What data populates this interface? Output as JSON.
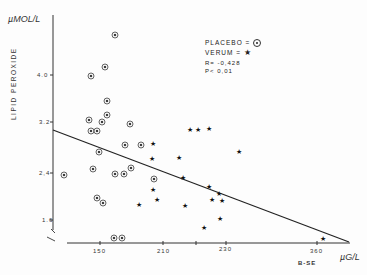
{
  "chart_data": {
    "type": "scatter",
    "title": "",
    "xlabel": "B-SE",
    "x_unit": "µG/L",
    "ylabel": "LIPID PEROXIDE",
    "y_unit": "µMOL/L",
    "x_ticks": [
      "150",
      "210",
      "230",
      "360"
    ],
    "y_ticks": [
      "4.0",
      "3.2",
      "2.4",
      "1.6"
    ],
    "ylim": [
      1.3,
      5.2
    ],
    "grid": false,
    "legend_position": "upper right",
    "annotations": [
      "R = -0.428",
      "P < 0.01"
    ],
    "series": [
      {
        "name": "PLACEBO",
        "marker": "circled-dot",
        "points": [
          [
            160,
            5.0
          ],
          [
            152,
            4.0
          ],
          [
            150,
            3.2
          ],
          [
            153,
            3.1
          ],
          [
            148,
            3.1
          ],
          [
            155,
            3.1
          ],
          [
            153,
            3.4
          ],
          [
            160,
            3.5
          ],
          [
            165,
            2.9
          ],
          [
            170,
            2.9
          ],
          [
            151,
            2.6
          ],
          [
            148,
            2.4
          ],
          [
            160,
            2.4
          ],
          [
            165,
            2.4
          ],
          [
            172,
            2.5
          ],
          [
            130,
            2.4
          ],
          [
            152,
            2.0
          ],
          [
            155,
            1.9
          ],
          [
            185,
            2.3
          ],
          [
            160,
            1.4
          ],
          [
            162,
            1.4
          ]
        ]
      },
      {
        "name": "VERUM",
        "marker": "star",
        "points": [
          [
            217,
            3.1
          ],
          [
            219,
            3.1
          ],
          [
            225,
            3.1
          ],
          [
            195,
            2.8
          ],
          [
            195,
            2.6
          ],
          [
            208,
            2.6
          ],
          [
            236,
            2.7
          ],
          [
            210,
            2.3
          ],
          [
            225,
            2.2
          ],
          [
            229,
            2.1
          ],
          [
            224,
            2.0
          ],
          [
            231,
            2.0
          ],
          [
            196,
            1.9
          ],
          [
            190,
            1.8
          ],
          [
            210,
            1.8
          ],
          [
            230,
            1.7
          ],
          [
            221,
            1.5
          ],
          [
            355,
            1.4
          ]
        ]
      }
    ],
    "regression_line": {
      "x": [
        120,
        365
      ],
      "y": [
        3.0,
        1.3
      ]
    }
  },
  "labels": {
    "y_unit": "µMOL/L",
    "y_axis": "LIPID PEROXIDE",
    "x_axis": "B-SE",
    "x_unit": "µG/L",
    "legend_placebo": "PLACEBO = ",
    "legend_verum": "VERUM = ",
    "r_value": "R= -0,428",
    "p_value": "P< 0,01",
    "y_tick_0": "4.0",
    "y_tick_1": "3.2",
    "y_tick_2": "2,4",
    "y_tick_3": "1.6",
    "x_tick_0": "150",
    "x_tick_1": "210",
    "x_tick_2": "230",
    "x_tick_3": "360"
  },
  "pixel_points": {
    "placebo": [
      [
        115,
        35
      ],
      [
        91,
        76
      ],
      [
        105,
        67
      ],
      [
        107,
        101
      ],
      [
        107,
        115
      ],
      [
        89,
        120
      ],
      [
        102,
        122
      ],
      [
        91,
        131
      ],
      [
        97,
        131
      ],
      [
        130,
        124
      ],
      [
        125,
        145
      ],
      [
        141,
        145
      ],
      [
        99,
        152
      ],
      [
        93,
        169
      ],
      [
        115,
        174
      ],
      [
        124,
        174
      ],
      [
        131,
        168
      ],
      [
        64,
        175
      ],
      [
        154,
        179
      ],
      [
        97,
        198
      ],
      [
        103,
        203
      ],
      [
        114,
        238
      ],
      [
        122,
        238
      ]
    ],
    "verum": [
      [
        190,
        129
      ],
      [
        198,
        129
      ],
      [
        209,
        128
      ],
      [
        153,
        143
      ],
      [
        152,
        158
      ],
      [
        179,
        157
      ],
      [
        239,
        151
      ],
      [
        183,
        177
      ],
      [
        209,
        186
      ],
      [
        219,
        193
      ],
      [
        212,
        199
      ],
      [
        222,
        200
      ],
      [
        153,
        189
      ],
      [
        157,
        199
      ],
      [
        139,
        204
      ],
      [
        185,
        205
      ],
      [
        220,
        218
      ],
      [
        204,
        227
      ],
      [
        323,
        238
      ]
    ]
  }
}
